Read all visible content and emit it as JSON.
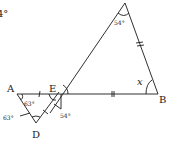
{
  "diagram": {
    "type": "geometry",
    "partial_text_top_left": "4°",
    "points": {
      "A": "A",
      "B": "B",
      "D": "D",
      "E": "E"
    },
    "angles": {
      "C_apex": "54°",
      "A_interior": "63°",
      "D_side": "63°",
      "E_vertical": "54°",
      "B_unknown": "x"
    },
    "colors": {
      "line": "#1a1a1a",
      "background": "#ffffff"
    }
  }
}
